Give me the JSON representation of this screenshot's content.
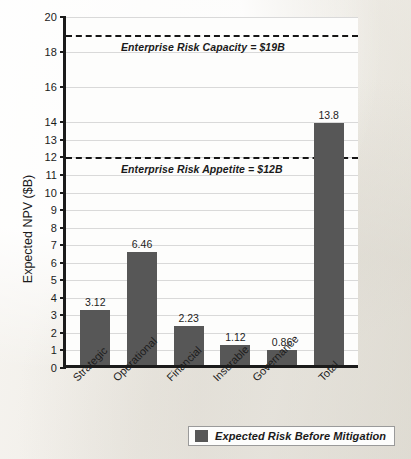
{
  "chart_data": {
    "type": "bar",
    "title": "",
    "xlabel": "",
    "ylabel": "Expected NPV ($B)",
    "ylim": [
      0,
      20
    ],
    "grid": true,
    "legend_position": "bottom-right",
    "categories": [
      "Strategic",
      "Operational",
      "Financial",
      "Insurable",
      "Governance",
      "Total"
    ],
    "values": [
      3.12,
      6.46,
      2.23,
      1.12,
      0.86,
      13.8
    ],
    "value_labels": [
      "3.12",
      "6.46",
      "2.23",
      "1.12",
      "0.86",
      "13.8"
    ],
    "series": [
      {
        "name": "Expected Risk Before Mitigation",
        "color": "#575757",
        "values": [
          3.12,
          6.46,
          2.23,
          1.12,
          0.86,
          13.8
        ]
      }
    ],
    "y_ticks": [
      0,
      1,
      2,
      3,
      4,
      5,
      6,
      7,
      8,
      9,
      10,
      11,
      12,
      13,
      14,
      16,
      18,
      20
    ],
    "y_tick_labels": [
      "0",
      "1",
      "2",
      "3",
      "4",
      "5",
      "6",
      "7",
      "8",
      "9",
      "10",
      "11",
      "12",
      "13",
      "14",
      "16",
      "18",
      "20"
    ],
    "annotations": [
      {
        "name": "enterprise-risk-capacity",
        "value": 19,
        "text": "Enterprise Risk Capacity = $19B",
        "style": "dashed-reference-line"
      },
      {
        "name": "enterprise-risk-appetite",
        "value": 12,
        "text": "Enterprise Risk Appetite = $12B",
        "style": "dashed-reference-line"
      }
    ]
  },
  "legend": {
    "entries": [
      {
        "label": "Expected Risk Before Mitigation",
        "color": "#575757"
      }
    ]
  },
  "colors": {
    "bar": "#575757",
    "axis": "#1b1b1b",
    "gridline": "#d9d9d9",
    "reference_line": "#161616",
    "plot_background": "#fdfdfc",
    "page_background": "#f3f1ec"
  }
}
